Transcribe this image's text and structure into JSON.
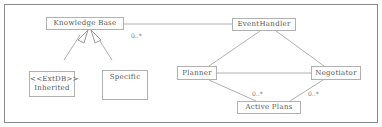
{
  "diagram": {
    "classes": {
      "knowledge_base": "Knowledge Base",
      "event_handler": "EventHandler",
      "inherited_stereotype": "<<ExtDB>>",
      "inherited": "Inherited",
      "specific": "Specific",
      "planner": "Planner",
      "negotiator": "Negotiator",
      "active_plans": "Active Plans"
    },
    "multiplicities": {
      "kb_event": "0..*",
      "planner_active": "0..*",
      "negotiator_active": "0..*"
    },
    "colors": {
      "line": "#b0b0b0",
      "border": "#8a8a8a",
      "text": "#555555"
    }
  }
}
